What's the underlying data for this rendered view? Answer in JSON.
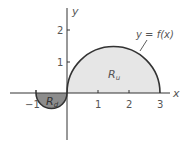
{
  "figure": {
    "axis_labels": {
      "x": "x",
      "y": "y"
    },
    "x_ticks": [
      {
        "value": -1,
        "label": "−1"
      },
      {
        "value": 1,
        "label": "1"
      },
      {
        "value": 2,
        "label": "2"
      },
      {
        "value": 3,
        "label": "3"
      }
    ],
    "y_ticks": [
      {
        "value": 1,
        "label": "1"
      },
      {
        "value": 2,
        "label": "2"
      }
    ],
    "curve_label": "y = f(x)",
    "regions": [
      {
        "id": "upper",
        "label_main": "R",
        "label_sub": "u",
        "fill": "#e6e6e6",
        "description": "semicircle above x-axis from x=0 to x=3, radius 1.5"
      },
      {
        "id": "lower",
        "label_main": "R",
        "label_sub": "d",
        "fill": "#8c8c8c",
        "description": "semicircle below x-axis from x=-1 to x=0, radius 0.5"
      }
    ],
    "colors": {
      "curve": "#333333",
      "axis": "#333333",
      "text": "#555555"
    }
  }
}
